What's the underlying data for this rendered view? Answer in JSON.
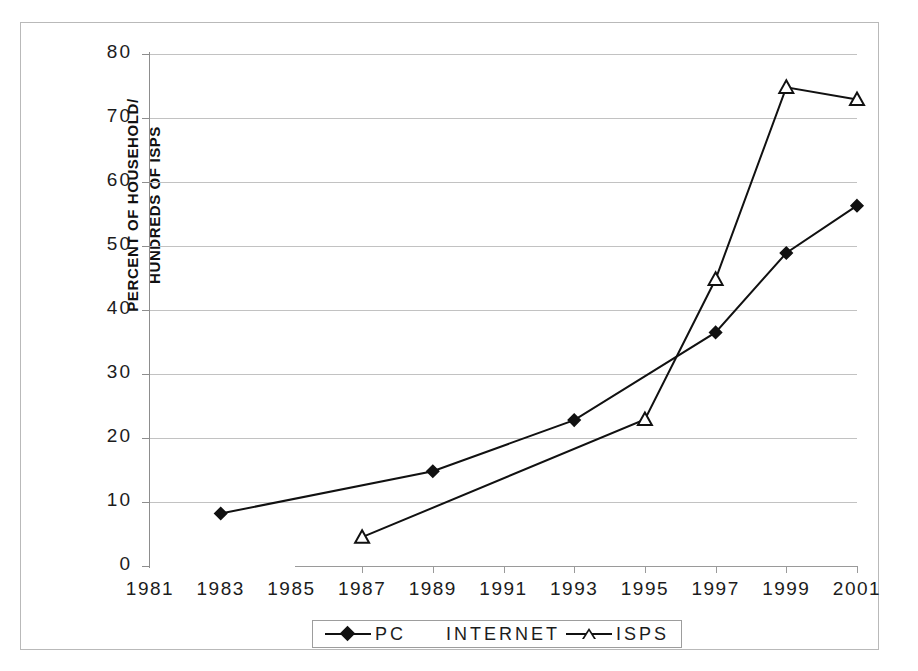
{
  "chart_data": {
    "type": "line",
    "title": "",
    "xlabel": "",
    "ylabel": "PERCENT OF HOUSEHOLD/ HUNDREDS OF ISPS",
    "ylabel_line1": "PERCENT OF HOUSEHOLD/",
    "ylabel_line2": "HUNDREDS OF ISPS",
    "x": [
      1981,
      1983,
      1985,
      1987,
      1989,
      1991,
      1993,
      1995,
      1997,
      1999,
      2001
    ],
    "xtick_labels": [
      "1981",
      "1983",
      "1985",
      "1987",
      "1989",
      "1991",
      "1993",
      "1995",
      "1997",
      "1999",
      "2001"
    ],
    "ytick_labels": [
      "0",
      "10",
      "20",
      "30",
      "40",
      "50",
      "60",
      "70",
      "80"
    ],
    "yticks": [
      0,
      10,
      20,
      30,
      40,
      50,
      60,
      70,
      80
    ],
    "xlim": [
      1981,
      2001
    ],
    "ylim": [
      0,
      80
    ],
    "grid": "horizontal",
    "legend_position": "bottom",
    "series": [
      {
        "name": "PC INTERNET",
        "legend_label": "PC",
        "legend_label_extra": "INTERNET",
        "marker": "filled-diamond",
        "color": "#111111",
        "x": [
          1983,
          1989,
          1993,
          1997,
          1999,
          2001
        ],
        "values": [
          8.2,
          14.8,
          22.8,
          36.5,
          48.9,
          56.3
        ]
      },
      {
        "name": "ISPS",
        "legend_label": "ISPS",
        "marker": "open-triangle",
        "color": "#111111",
        "x": [
          1987,
          1995,
          1997,
          1999,
          2001
        ],
        "values": [
          4.5,
          22.9,
          44.8,
          74.8,
          72.9
        ]
      }
    ]
  },
  "legend": {
    "entries": [
      {
        "label": "PC",
        "marker": "filled-diamond"
      },
      {
        "label": "INTERNET",
        "marker": "none"
      },
      {
        "label": "ISPS",
        "marker": "open-triangle"
      }
    ]
  },
  "colors": {
    "series": "#111111",
    "gridline": "#c2c2c2",
    "axis": "#8d8d8d",
    "frame": "#b9b9b9",
    "background": "#ffffff",
    "text": "#1c1c1c"
  }
}
